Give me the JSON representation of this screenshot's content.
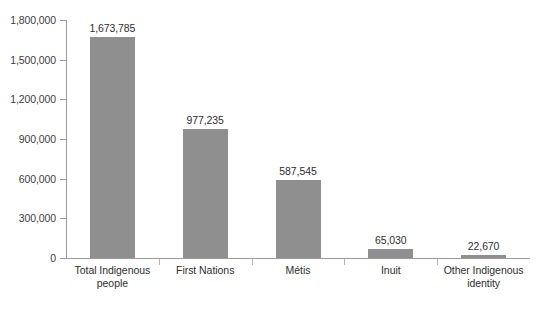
{
  "chart_data": {
    "type": "bar",
    "title": "",
    "subtitle": "",
    "xlabel": "",
    "ylabel": "",
    "categories": [
      "Total Indigenous people",
      "First Nations",
      "Métis",
      "Inuit",
      "Other Indigenous identity"
    ],
    "category_lines": [
      [
        "Total Indigenous",
        "people"
      ],
      [
        "First Nations"
      ],
      [
        "Métis"
      ],
      [
        "Inuit"
      ],
      [
        "Other Indigenous",
        "identity"
      ]
    ],
    "values": [
      1673785,
      977235,
      587545,
      65030,
      22670
    ],
    "value_labels": [
      "1,673,785",
      "977,235",
      "587,545",
      "65,030",
      "22,670"
    ],
    "ylim": [
      0,
      1800000
    ],
    "ytick_values": [
      0,
      300000,
      600000,
      900000,
      1200000,
      1500000,
      1800000
    ],
    "ytick_labels": [
      "0",
      "300,000",
      "600,000",
      "900,000",
      "1,200,000",
      "1,500,000",
      "1,800,000"
    ],
    "grid": false,
    "legend": false,
    "legend_position": "none",
    "bar_color": "#8f8f8f",
    "axis_color": "#9a9a9a",
    "text_color": "#2e2e2e",
    "background_color": "#ffffff"
  },
  "figure": {
    "caption": ""
  }
}
